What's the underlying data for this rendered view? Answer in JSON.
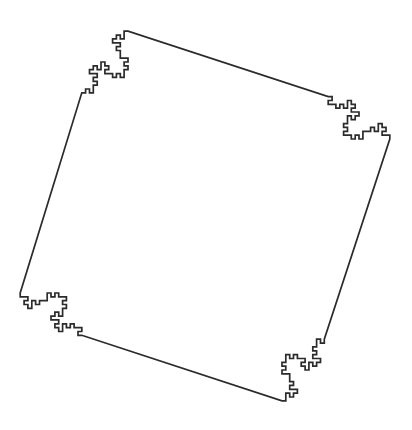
{
  "figure": {
    "kind": "fractal-line-drawing",
    "background_color": "#ffffff",
    "stroke_color": "#2b2b2b",
    "stroke_width": 1.7,
    "canvas": {
      "width": 412,
      "height": 430
    },
    "bounding_box": {
      "x_min": 20,
      "y_min": 22,
      "x_max": 390,
      "y_max": 410
    }
  },
  "chart_data": {
    "type": "line",
    "subtitle": "",
    "xlabel": "",
    "ylabel": "",
    "grid": false,
    "legend": [],
    "axis_visible": false,
    "tick_labels": {
      "x": [],
      "y": []
    },
    "xlim": [
      0,
      412
    ],
    "ylim": [
      0,
      430
    ],
    "construction": {
      "curve_name": "quadratic Koch curve, type 1 (Minkowski sausage)",
      "base_shape": "square",
      "iterations": 2,
      "generator_segments": 8,
      "generator_turns": [
        "F",
        "+F",
        "-F",
        "-F",
        "+F",
        "+F",
        "F",
        "-F"
      ],
      "scale_factor": 0.25,
      "fractal_dimension": 1.5,
      "closed_path": true,
      "sides_of_seed_polygon": 4,
      "unit_segment_px": 15.4,
      "seed_square": {
        "center_x": 205,
        "center_y": 216,
        "half_side": 123.2,
        "corners": [
          [
            81.8,
            92.8
          ],
          [
            328.2,
            92.8
          ],
          [
            328.2,
            339.2
          ],
          [
            81.8,
            339.2
          ]
        ]
      },
      "orientation_note": "generator bumps point outward from the seed square; top, bottom, left and right mid-edges carry the outermost single-unit nubs"
    },
    "series": [
      {
        "name": "fractal-outline",
        "description": "closed polyline of the level-2 quadratic Koch island",
        "point_count": 260
      }
    ]
  }
}
